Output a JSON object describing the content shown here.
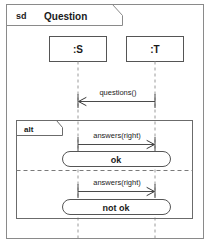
{
  "diagram": {
    "kind_label": "sd",
    "name": "Question",
    "type": "uml-sequence-diagram",
    "background_color": "#ffffff",
    "frame_color": "#8a8a8a",
    "text_color": "#1a1a1a"
  },
  "lifelines": [
    {
      "id": "S",
      "label": ":S",
      "x": 78
    },
    {
      "id": "T",
      "label": ":T",
      "x": 155
    }
  ],
  "messages": [
    {
      "id": "m1",
      "label": "questions()",
      "from": "T",
      "to": "S",
      "direction": "right-to-left",
      "y": 98,
      "arrow": "open"
    },
    {
      "id": "m2",
      "label": "answers(right)",
      "from": "S",
      "to": "T",
      "direction": "left-to-right",
      "y": 141,
      "arrow": "open"
    },
    {
      "id": "m3",
      "label": "answers(right)",
      "from": "S",
      "to": "T",
      "direction": "left-to-right",
      "y": 188,
      "arrow": "open"
    }
  ],
  "combined_fragment": {
    "operator": "alt",
    "operands": [
      {
        "id": "op1",
        "state_label": "ok"
      },
      {
        "id": "op2",
        "state_label": "not ok"
      }
    ]
  },
  "state_invariants": [
    {
      "id": "st1",
      "label": "ok",
      "y": 159
    },
    {
      "id": "st2",
      "label": "not ok",
      "y": 207
    }
  ]
}
